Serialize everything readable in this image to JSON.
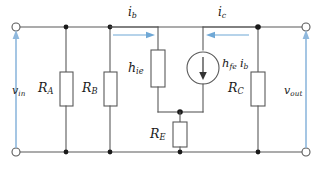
{
  "diagram": {
    "colors": {
      "wire": "#595959",
      "node": "#1a1a1a",
      "voltage_arrow": "#8fb8dd",
      "current_arrow": "#6fa8d6",
      "background": "#ffffff"
    }
  },
  "labels": {
    "v_in": {
      "base": "v",
      "sub": "in"
    },
    "v_out": {
      "base": "v",
      "sub": "out"
    },
    "r_a": {
      "base": "R",
      "sub": "A"
    },
    "r_b": {
      "base": "R",
      "sub": "B"
    },
    "r_c": {
      "base": "R",
      "sub": "C"
    },
    "r_e": {
      "base": "R",
      "sub": "E"
    },
    "h_ie": {
      "base": "h",
      "sub": "ie"
    },
    "i_b": {
      "base": "i",
      "sub": "b"
    },
    "i_c": {
      "base": "i",
      "sub": "c"
    },
    "source": {
      "base": "h",
      "sub": "fe",
      "base2": "i",
      "sub2": "b"
    }
  },
  "components": [
    {
      "name": "R_A",
      "type": "resistor",
      "orientation": "vertical"
    },
    {
      "name": "R_B",
      "type": "resistor",
      "orientation": "vertical"
    },
    {
      "name": "h_ie",
      "type": "resistor",
      "orientation": "vertical"
    },
    {
      "name": "R_E",
      "type": "resistor",
      "orientation": "vertical"
    },
    {
      "name": "R_C",
      "type": "resistor",
      "orientation": "vertical"
    },
    {
      "name": "h_fe i_b",
      "type": "dependent-current-source",
      "direction": "down"
    }
  ],
  "terminals": [
    {
      "name": "input-top",
      "style": "open-circle"
    },
    {
      "name": "input-bottom",
      "style": "open-circle"
    },
    {
      "name": "output-top",
      "style": "open-circle"
    },
    {
      "name": "output-bottom",
      "style": "open-circle"
    }
  ],
  "currents": [
    {
      "name": "i_b",
      "direction": "right",
      "location": "base-branch-top"
    },
    {
      "name": "i_c",
      "direction": "left",
      "location": "collector-branch-top"
    }
  ],
  "voltages": [
    {
      "name": "v_in",
      "direction": "up",
      "location": "left-port"
    },
    {
      "name": "v_out",
      "direction": "up",
      "location": "right-port"
    }
  ]
}
